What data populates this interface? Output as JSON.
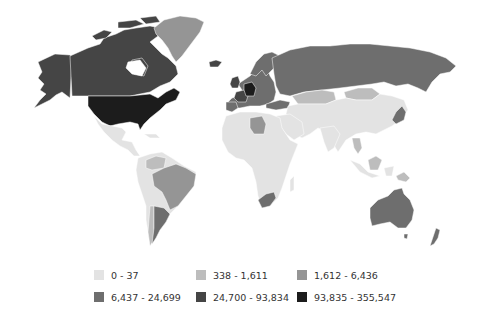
{
  "map": {
    "type": "choropleth",
    "region": "world",
    "palette": {
      "bin0": "#e3e3e3",
      "bin1": "#bdbdbd",
      "bin2": "#959595",
      "bin3": "#6e6e6e",
      "bin4": "#454545",
      "bin5": "#1c1c1c"
    }
  },
  "legend": {
    "items": [
      {
        "label": "0 - 37",
        "color": "#e3e3e3"
      },
      {
        "label": "338 - 1,611",
        "color": "#bdbdbd"
      },
      {
        "label": "1,612 - 6,436",
        "color": "#959595"
      },
      {
        "label": "6,437 - 24,699",
        "color": "#6e6e6e"
      },
      {
        "label": "24,700 - 93,834",
        "color": "#454545"
      },
      {
        "label": "93,835 - 355,547",
        "color": "#1c1c1c"
      }
    ]
  },
  "regions": [
    {
      "name": "United States",
      "bin": 5
    },
    {
      "name": "Germany",
      "bin": 5
    },
    {
      "name": "Canada",
      "bin": 4
    },
    {
      "name": "Alaska",
      "bin": 4
    },
    {
      "name": "United Kingdom",
      "bin": 4
    },
    {
      "name": "France",
      "bin": 4
    },
    {
      "name": "Australia",
      "bin": 3
    },
    {
      "name": "Russia",
      "bin": 3
    },
    {
      "name": "Argentina",
      "bin": 3
    },
    {
      "name": "South Africa",
      "bin": 3
    },
    {
      "name": "Japan",
      "bin": 3
    },
    {
      "name": "New Zealand",
      "bin": 3
    },
    {
      "name": "Spain",
      "bin": 3
    },
    {
      "name": "Scandinavia",
      "bin": 3
    },
    {
      "name": "Turkey",
      "bin": 3
    },
    {
      "name": "Greenland",
      "bin": 2
    },
    {
      "name": "Brazil",
      "bin": 2
    },
    {
      "name": "Libya",
      "bin": 2
    },
    {
      "name": "Kazakhstan",
      "bin": 1
    },
    {
      "name": "Mongolia",
      "bin": 1
    },
    {
      "name": "Venezuela",
      "bin": 1
    },
    {
      "name": "Chile",
      "bin": 1
    },
    {
      "name": "Thailand",
      "bin": 1
    },
    {
      "name": "Borneo",
      "bin": 1
    },
    {
      "name": "Papua New Guinea",
      "bin": 1
    },
    {
      "name": "Africa (rest)",
      "bin": 0
    },
    {
      "name": "Asia (rest)",
      "bin": 0
    },
    {
      "name": "Mexico / Central America",
      "bin": 0
    },
    {
      "name": "South America (rest)",
      "bin": 0
    },
    {
      "name": "India",
      "bin": 0
    },
    {
      "name": "Middle East",
      "bin": 0
    },
    {
      "name": "China",
      "bin": 0
    },
    {
      "name": "Indonesia",
      "bin": 0
    }
  ]
}
